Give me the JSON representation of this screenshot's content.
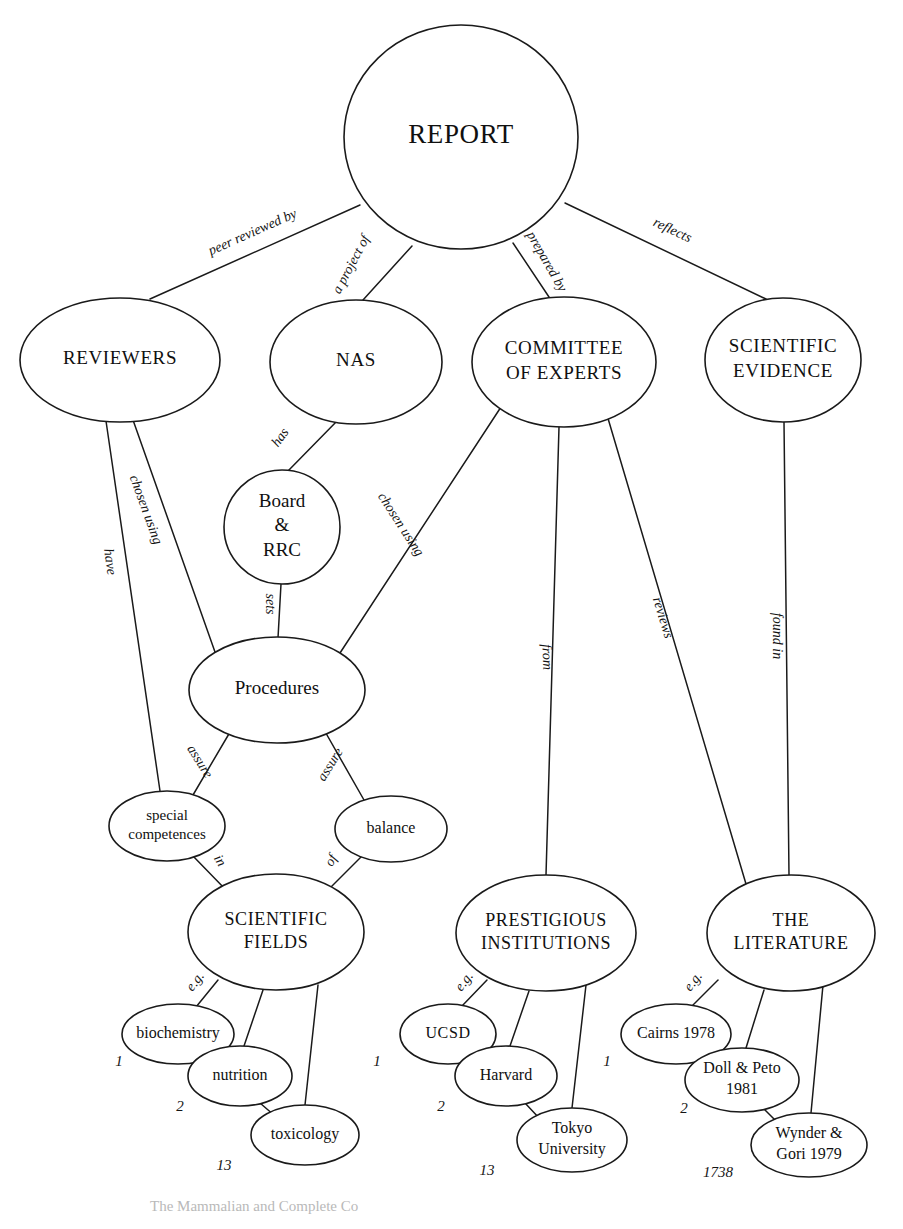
{
  "diagram": {
    "background_color": "#ffffff",
    "stroke_color": "#1a1a1a",
    "text_color": "#101010",
    "width": 903,
    "height": 1229
  },
  "nodes": [
    {
      "id": "report",
      "label": "REPORT",
      "lines": [
        "REPORT"
      ],
      "cx": 461,
      "cy": 137,
      "rx": 117,
      "ry": 112,
      "font_size": 27,
      "style": "caps"
    },
    {
      "id": "reviewers",
      "label": "REVIEWERS",
      "lines": [
        "REVIEWERS"
      ],
      "cx": 120,
      "cy": 360,
      "rx": 100,
      "ry": 62,
      "font_size": 19,
      "style": "caps"
    },
    {
      "id": "nas",
      "label": "NAS",
      "lines": [
        "NAS"
      ],
      "cx": 356,
      "cy": 362,
      "rx": 86,
      "ry": 62,
      "font_size": 19,
      "style": "caps"
    },
    {
      "id": "committee",
      "label": "COMMITTEE OF EXPERTS",
      "lines": [
        "COMMITTEE",
        "OF EXPERTS"
      ],
      "cx": 564,
      "cy": 362,
      "rx": 92,
      "ry": 65,
      "font_size": 19,
      "style": "caps"
    },
    {
      "id": "evidence",
      "label": "SCIENTIFIC EVIDENCE",
      "lines": [
        "SCIENTIFIC",
        "EVIDENCE"
      ],
      "cx": 783,
      "cy": 360,
      "rx": 78,
      "ry": 62,
      "font_size": 19,
      "style": "caps"
    },
    {
      "id": "board",
      "label": "Board & RRC",
      "lines": [
        "Board",
        "&",
        "RRC"
      ],
      "cx": 282,
      "cy": 527,
      "rx": 58,
      "ry": 57,
      "font_size": 19,
      "style": "mixed"
    },
    {
      "id": "procedures",
      "label": "Procedures",
      "lines": [
        "Procedures"
      ],
      "cx": 277,
      "cy": 690,
      "rx": 88,
      "ry": 53,
      "font_size": 19,
      "style": "mixed"
    },
    {
      "id": "competences",
      "label": "special competences",
      "lines": [
        "special",
        "competences"
      ],
      "cx": 167,
      "cy": 826,
      "rx": 58,
      "ry": 35,
      "font_size": 15,
      "style": "mixed"
    },
    {
      "id": "balance",
      "label": "balance",
      "lines": [
        "balance"
      ],
      "cx": 391,
      "cy": 829,
      "rx": 56,
      "ry": 33,
      "font_size": 16,
      "style": "mixed"
    },
    {
      "id": "fields",
      "label": "SCIENTIFIC FIELDS",
      "lines": [
        "SCIENTIFIC",
        "FIELDS"
      ],
      "cx": 276,
      "cy": 932,
      "rx": 88,
      "ry": 58,
      "font_size": 18,
      "style": "caps"
    },
    {
      "id": "institutions",
      "label": "PRESTIGIOUS INSTITUTIONS",
      "lines": [
        "PRESTIGIOUS",
        "INSTITUTIONS"
      ],
      "cx": 546,
      "cy": 933,
      "rx": 90,
      "ry": 58,
      "font_size": 18,
      "style": "caps"
    },
    {
      "id": "literature",
      "label": "THE LITERATURE",
      "lines": [
        "THE",
        "LITERATURE"
      ],
      "cx": 791,
      "cy": 933,
      "rx": 84,
      "ry": 58,
      "font_size": 18,
      "style": "caps"
    },
    {
      "id": "biochemistry",
      "label": "biochemistry",
      "lines": [
        "biochemistry"
      ],
      "cx": 178,
      "cy": 1034,
      "rx": 56,
      "ry": 30,
      "font_size": 16,
      "style": "mixed"
    },
    {
      "id": "nutrition",
      "label": "nutrition",
      "lines": [
        "nutrition"
      ],
      "cx": 240,
      "cy": 1076,
      "rx": 52,
      "ry": 30,
      "font_size": 16,
      "style": "mixed"
    },
    {
      "id": "toxicology",
      "label": "toxicology",
      "lines": [
        "toxicology"
      ],
      "cx": 305,
      "cy": 1135,
      "rx": 54,
      "ry": 30,
      "font_size": 16,
      "style": "mixed"
    },
    {
      "id": "ucsd",
      "label": "UCSD",
      "lines": [
        "UCSD"
      ],
      "cx": 448,
      "cy": 1034,
      "rx": 48,
      "ry": 30,
      "font_size": 16,
      "style": "caps"
    },
    {
      "id": "harvard",
      "label": "Harvard",
      "lines": [
        "Harvard"
      ],
      "cx": 506,
      "cy": 1076,
      "rx": 51,
      "ry": 30,
      "font_size": 16,
      "style": "mixed"
    },
    {
      "id": "tokyo",
      "label": "Tokyo University",
      "lines": [
        "Tokyo",
        "University"
      ],
      "cx": 572,
      "cy": 1140,
      "rx": 55,
      "ry": 32,
      "font_size": 16,
      "style": "mixed"
    },
    {
      "id": "cairns",
      "label": "Cairns 1978",
      "lines": [
        "Cairns 1978"
      ],
      "cx": 676,
      "cy": 1034,
      "rx": 55,
      "ry": 30,
      "font_size": 16,
      "style": "mixed"
    },
    {
      "id": "dollpeto",
      "label": "Doll & Peto 1981",
      "lines": [
        "Doll & Peto",
        "1981"
      ],
      "cx": 742,
      "cy": 1080,
      "rx": 57,
      "ry": 32,
      "font_size": 16,
      "style": "mixed"
    },
    {
      "id": "wynder",
      "label": "Wynder & Gori 1979",
      "lines": [
        "Wynder &",
        "Gori 1979"
      ],
      "cx": 809,
      "cy": 1145,
      "rx": 58,
      "ry": 32,
      "font_size": 16,
      "style": "mixed"
    }
  ],
  "edges": [
    {
      "id": "report-reviewers",
      "from": "report",
      "to": "reviewers",
      "x1": 360,
      "y1": 205,
      "x2": 150,
      "y2": 299,
      "label": "peer reviewed by",
      "lx": 253,
      "ly": 233,
      "rotate": -24
    },
    {
      "id": "report-nas",
      "from": "report",
      "to": "nas",
      "x1": 412,
      "y1": 246,
      "x2": 363,
      "y2": 300,
      "label": "a project of",
      "lx": 352,
      "ly": 265,
      "rotate": -62
    },
    {
      "id": "report-committee",
      "from": "report",
      "to": "committee",
      "x1": 513,
      "y1": 243,
      "x2": 549,
      "y2": 297,
      "label": "prepared by",
      "lx": 546,
      "ly": 262,
      "rotate": 60
    },
    {
      "id": "report-evidence",
      "from": "report",
      "to": "evidence",
      "x1": 565,
      "y1": 203,
      "x2": 766,
      "y2": 299,
      "label": "reflects",
      "lx": 672,
      "ly": 231,
      "rotate": 25
    },
    {
      "id": "nas-board",
      "from": "nas",
      "to": "board",
      "x1": 337,
      "y1": 421,
      "x2": 288,
      "y2": 471,
      "label": "has",
      "lx": 281,
      "ly": 438,
      "rotate": -54
    },
    {
      "id": "board-procedures",
      "from": "board",
      "to": "procedures",
      "x1": 281,
      "y1": 584,
      "x2": 278,
      "y2": 638,
      "label": "sets",
      "lx": 269,
      "ly": 604,
      "rotate": 90
    },
    {
      "id": "reviewers-procs",
      "from": "reviewers",
      "to": "procedures",
      "x1": 133,
      "y1": 420,
      "x2": 215,
      "y2": 652,
      "label": "chosen using",
      "lx": 145,
      "ly": 510,
      "rotate": 70
    },
    {
      "id": "reviewers-comps",
      "from": "reviewers",
      "to": "competences",
      "x1": 106,
      "y1": 421,
      "x2": 160,
      "y2": 791,
      "label": "have",
      "lx": 109,
      "ly": 562,
      "rotate": 82
    },
    {
      "id": "committee-procs",
      "from": "committee",
      "to": "procedures",
      "x1": 501,
      "y1": 407,
      "x2": 340,
      "y2": 653,
      "label": "chosen using",
      "lx": 400,
      "ly": 525,
      "rotate": 57
    },
    {
      "id": "committee-inst",
      "from": "committee",
      "to": "institutions",
      "x1": 559,
      "y1": 427,
      "x2": 546,
      "y2": 875,
      "label": "from",
      "lx": 546,
      "ly": 657,
      "rotate": 88
    },
    {
      "id": "committee-lit",
      "from": "committee",
      "to": "literature",
      "x1": 607,
      "y1": 415,
      "x2": 746,
      "y2": 884,
      "label": "reviews",
      "lx": 662,
      "ly": 618,
      "rotate": 73
    },
    {
      "id": "evidence-lit",
      "from": "evidence",
      "to": "literature",
      "x1": 784,
      "y1": 422,
      "x2": 789,
      "y2": 875,
      "label": "found in",
      "lx": 776,
      "ly": 636,
      "rotate": 90
    },
    {
      "id": "procs-comps",
      "from": "procedures",
      "to": "competences",
      "x1": 233,
      "y1": 727,
      "x2": 193,
      "y2": 795,
      "label": "assure",
      "lx": 199,
      "ly": 762,
      "rotate": 58
    },
    {
      "id": "procs-balance",
      "from": "procedures",
      "to": "balance",
      "x1": 323,
      "y1": 728,
      "x2": 364,
      "y2": 800,
      "label": "assure",
      "lx": 331,
      "ly": 765,
      "rotate": -58
    },
    {
      "id": "comps-fields",
      "from": "competences",
      "to": "fields",
      "x1": 193,
      "y1": 856,
      "x2": 226,
      "y2": 890,
      "label": "in",
      "lx": 219,
      "ly": 861,
      "rotate": 60
    },
    {
      "id": "balance-fields",
      "from": "balance",
      "to": "fields",
      "x1": 362,
      "y1": 856,
      "x2": 328,
      "y2": 890,
      "label": "of",
      "lx": 332,
      "ly": 861,
      "rotate": -60
    },
    {
      "id": "fields-biochem",
      "from": "fields",
      "to": "biochemistry",
      "x1": 218,
      "y1": 980,
      "x2": 196,
      "y2": 1007,
      "label": "e.g.",
      "lx": 196,
      "ly": 982,
      "rotate": -52
    },
    {
      "id": "fields-nutrition",
      "from": "fields",
      "to": "nutrition",
      "x1": 263,
      "y1": 990,
      "x2": 244,
      "y2": 1046,
      "label": "",
      "lx": 0,
      "ly": 0,
      "rotate": 0
    },
    {
      "id": "fields-toxicology",
      "from": "fields",
      "to": "toxicology",
      "x1": 318,
      "y1": 985,
      "x2": 305,
      "y2": 1105,
      "label": "",
      "lx": 0,
      "ly": 0,
      "rotate": 0
    },
    {
      "id": "nutrition-tox",
      "from": "nutrition",
      "to": "toxicology",
      "x1": 260,
      "y1": 1103,
      "x2": 275,
      "y2": 1116,
      "label": "",
      "lx": 0,
      "ly": 0,
      "rotate": 0
    },
    {
      "id": "inst-ucsd",
      "from": "institutions",
      "to": "ucsd",
      "x1": 487,
      "y1": 980,
      "x2": 462,
      "y2": 1006,
      "label": "e.g.",
      "lx": 465,
      "ly": 982,
      "rotate": -52
    },
    {
      "id": "inst-harvard",
      "from": "institutions",
      "to": "harvard",
      "x1": 529,
      "y1": 991,
      "x2": 510,
      "y2": 1046,
      "label": "",
      "lx": 0,
      "ly": 0,
      "rotate": 0
    },
    {
      "id": "inst-tokyo",
      "from": "institutions",
      "to": "tokyo",
      "x1": 586,
      "y1": 985,
      "x2": 572,
      "y2": 1108,
      "label": "",
      "lx": 0,
      "ly": 0,
      "rotate": 0
    },
    {
      "id": "harvard-tokyo",
      "from": "harvard",
      "to": "tokyo",
      "x1": 525,
      "y1": 1103,
      "x2": 540,
      "y2": 1119,
      "label": "",
      "lx": 0,
      "ly": 0,
      "rotate": 0
    },
    {
      "id": "lit-cairns",
      "from": "literature",
      "to": "cairns",
      "x1": 718,
      "y1": 980,
      "x2": 692,
      "y2": 1006,
      "label": "e.g.",
      "lx": 694,
      "ly": 982,
      "rotate": -52
    },
    {
      "id": "lit-dollpeto",
      "from": "literature",
      "to": "dollpeto",
      "x1": 764,
      "y1": 990,
      "x2": 746,
      "y2": 1048,
      "label": "",
      "lx": 0,
      "ly": 0,
      "rotate": 0
    },
    {
      "id": "lit-wynder",
      "from": "literature",
      "to": "wynder",
      "x1": 823,
      "y1": 985,
      "x2": 811,
      "y2": 1113,
      "label": "",
      "lx": 0,
      "ly": 0,
      "rotate": 0
    },
    {
      "id": "dollpeto-wynder",
      "from": "dollpeto",
      "to": "wynder",
      "x1": 762,
      "y1": 1107,
      "x2": 777,
      "y2": 1122,
      "label": "",
      "lx": 0,
      "ly": 0,
      "rotate": 0
    }
  ],
  "index_numbers": [
    {
      "id": "idx-biochemistry",
      "value": "1",
      "x": 119,
      "y": 1063
    },
    {
      "id": "idx-nutrition",
      "value": "2",
      "x": 180,
      "y": 1108
    },
    {
      "id": "idx-toxicology",
      "value": "13",
      "x": 224,
      "y": 1167
    },
    {
      "id": "idx-ucsd",
      "value": "1",
      "x": 377,
      "y": 1063
    },
    {
      "id": "idx-harvard",
      "value": "2",
      "x": 441,
      "y": 1108
    },
    {
      "id": "idx-tokyo",
      "value": "13",
      "x": 487,
      "y": 1172
    },
    {
      "id": "idx-cairns",
      "value": "1",
      "x": 607,
      "y": 1063
    },
    {
      "id": "idx-dollpeto",
      "value": "2",
      "x": 684,
      "y": 1110
    },
    {
      "id": "idx-wynder",
      "value": "1738",
      "x": 718,
      "y": 1174
    }
  ],
  "caption": {
    "text": "The Mammalian and Complete Co",
    "x": 150,
    "y": 1208
  }
}
